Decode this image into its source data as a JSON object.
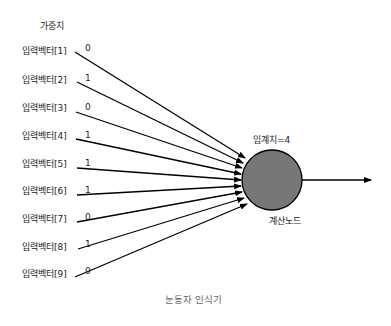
{
  "diagram": {
    "weights_header": "가중치",
    "threshold_label": "임계치=4",
    "node_label": "계산노드",
    "caption": "눈동자 인식기",
    "node_color": "#777777",
    "inputs": [
      {
        "label": "입력벡터[1]",
        "weight": "0"
      },
      {
        "label": "입력벡터[2]",
        "weight": "1"
      },
      {
        "label": "입력벡터[3]",
        "weight": "0"
      },
      {
        "label": "입력벡터[4]",
        "weight": "1"
      },
      {
        "label": "입력벡터[5]",
        "weight": "1"
      },
      {
        "label": "입력벡터[6]",
        "weight": "1"
      },
      {
        "label": "입력벡터[7]",
        "weight": "0"
      },
      {
        "label": "입력벡터[8]",
        "weight": "1"
      },
      {
        "label": "입력벡터[9]",
        "weight": "0"
      }
    ]
  }
}
